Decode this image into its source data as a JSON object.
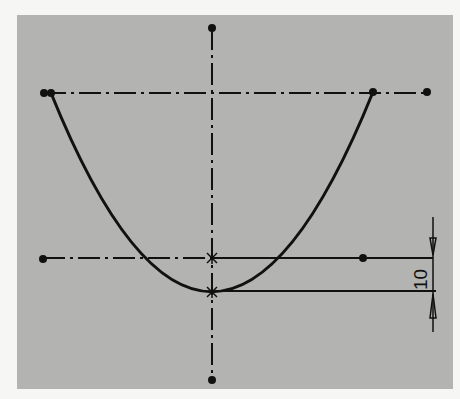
{
  "sketch": {
    "background_color": "#b3b3b1",
    "line_color": "#111111",
    "centerline_vertical": {
      "x": 212,
      "y1": 28,
      "y2": 380
    },
    "centerline_top": {
      "y": 93,
      "x1": 44,
      "x2": 427
    },
    "reference_line": {
      "y": 258,
      "x1": 43,
      "x2": 433,
      "dot_x": 363
    },
    "parabola": {
      "vertex": [
        212,
        292
      ],
      "left_end": [
        51,
        93
      ],
      "right_end": [
        373,
        92
      ]
    },
    "dimension": {
      "value": "10",
      "x": 433,
      "y_top": 258,
      "y_bottom": 291,
      "extends_from": 217,
      "extends_to": 332
    }
  }
}
